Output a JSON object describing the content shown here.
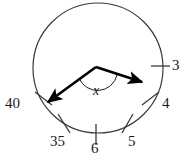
{
  "figure": {
    "kind": "circular-dial-diagram",
    "background_color": "#ffffff",
    "stroke_color": "#3a3a3a",
    "hand_color": "#000000",
    "text_color": "#1a1a1a",
    "circle": {
      "cx": 98,
      "cy": 68,
      "r": 65
    },
    "vertex": {
      "x": 96,
      "y": 67
    },
    "angle_label": "x",
    "hands": [
      {
        "name": "hand-to-40",
        "tip_x": 44,
        "tip_y": 106
      },
      {
        "name": "hand-to-4",
        "tip_x": 146,
        "tip_y": 85
      }
    ],
    "ticks": [
      {
        "label": "3",
        "label_x": 172,
        "label_y": 58,
        "tick_x1": 151,
        "tick_y1": 66,
        "tick_x2": 170,
        "tick_y2": 66
      },
      {
        "label": "4",
        "label_x": 162,
        "label_y": 96,
        "tick_x1": 142,
        "tick_y1": 105,
        "tick_x2": 159,
        "tick_y2": 92
      },
      {
        "label": "5",
        "label_x": 128,
        "label_y": 134,
        "tick_x1": 122,
        "tick_y1": 133,
        "tick_x2": 133,
        "tick_y2": 114
      },
      {
        "label": "6",
        "label_x": 91,
        "label_y": 141,
        "tick_x1": 96,
        "tick_y1": 124,
        "tick_x2": 96,
        "tick_y2": 145
      },
      {
        "label": "35",
        "label_x": 50,
        "label_y": 134,
        "tick_x1": 58,
        "tick_y1": 114,
        "tick_x2": 70,
        "tick_y2": 133
      },
      {
        "label": "40",
        "label_x": 5,
        "label_y": 96,
        "tick_x1": 35,
        "tick_y1": 92,
        "tick_x2": 52,
        "tick_y2": 105
      }
    ]
  }
}
